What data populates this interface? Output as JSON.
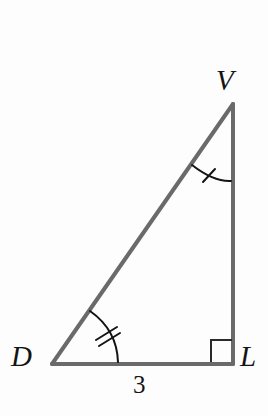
{
  "figure": {
    "background_color": "#fdfdfd",
    "stroke_color": "#6a6a6a",
    "mark_color": "#141414",
    "label_color": "#141414",
    "stroke_width": 4,
    "mark_stroke_width": 2
  },
  "vertices": {
    "V": {
      "label": "V",
      "x": 233,
      "y": 104,
      "label_x": 228,
      "label_y": 82
    },
    "D": {
      "label": "D",
      "x": 52,
      "y": 364,
      "label_x": 23,
      "label_y": 360
    },
    "L": {
      "label": "L",
      "x": 233,
      "y": 364,
      "label_x": 250,
      "label_y": 360
    }
  },
  "sides": [
    {
      "name": "DL",
      "from": "D",
      "to": "L",
      "label": "3",
      "label_x": 141,
      "label_y": 387
    },
    {
      "name": "VL",
      "from": "V",
      "to": "L",
      "label": ""
    },
    {
      "name": "DV",
      "from": "D",
      "to": "V",
      "label": ""
    }
  ],
  "angle_marks": [
    {
      "at": "V",
      "type": "arc",
      "tick_count": 1,
      "arc_path": "M 192 165 Q 214 182 231 181",
      "ticks": [
        "M 203 182 L 215 169"
      ]
    },
    {
      "at": "D",
      "type": "arc",
      "tick_count": 2,
      "arc_path": "M 90 311 Q 117 330 118 362",
      "ticks": [
        "M 96 340 L 117 327",
        "M 99 346 L 120 333"
      ]
    },
    {
      "at": "L",
      "type": "right-angle",
      "tick_count": 0,
      "square_path": "M 211 362 L 211 340 L 232 340"
    }
  ],
  "measures": {
    "base_length": "3"
  }
}
